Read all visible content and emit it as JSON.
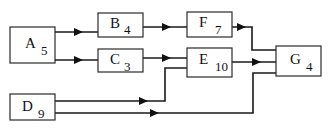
{
  "diagram": {
    "type": "activity-network",
    "nodes": [
      {
        "id": "A",
        "label": "A",
        "duration": "5"
      },
      {
        "id": "B",
        "label": "B",
        "duration": "4"
      },
      {
        "id": "C",
        "label": "C",
        "duration": "3"
      },
      {
        "id": "D",
        "label": "D",
        "duration": "9"
      },
      {
        "id": "E",
        "label": "E",
        "duration": "10"
      },
      {
        "id": "F",
        "label": "F",
        "duration": "7"
      },
      {
        "id": "G",
        "label": "G",
        "duration": "4"
      }
    ],
    "edges": [
      {
        "from": "A",
        "to": "B"
      },
      {
        "from": "A",
        "to": "C"
      },
      {
        "from": "B",
        "to": "F"
      },
      {
        "from": "C",
        "to": "E"
      },
      {
        "from": "D",
        "to": "E"
      },
      {
        "from": "D",
        "to": "G"
      },
      {
        "from": "E",
        "to": "G"
      },
      {
        "from": "F",
        "to": "G"
      }
    ]
  }
}
